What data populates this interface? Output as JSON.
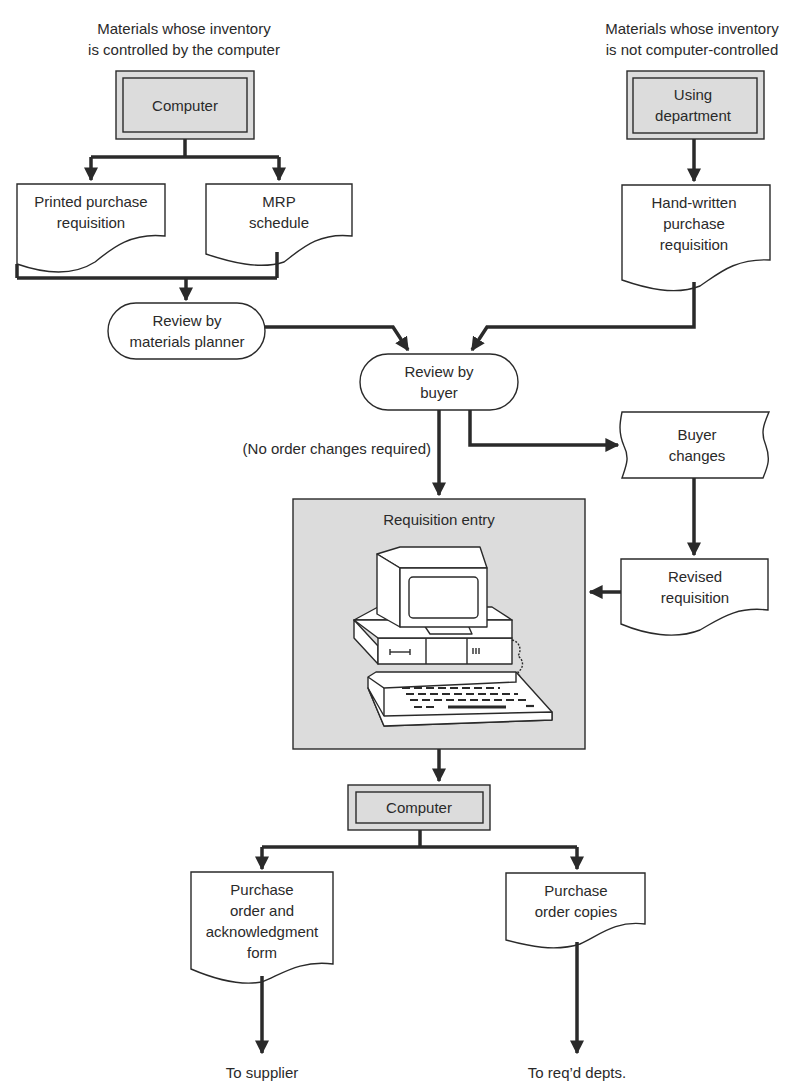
{
  "diagram": {
    "type": "flowchart",
    "headers": {
      "left": [
        "Materials whose inventory",
        "is controlled by the computer"
      ],
      "right": [
        "Materials whose inventory",
        "is not computer-controlled"
      ]
    },
    "nodes": {
      "computer_top": {
        "shape": "double-box",
        "label": [
          "Computer"
        ]
      },
      "using_department": {
        "shape": "double-box",
        "label": [
          "Using",
          "department"
        ]
      },
      "printed_requisition": {
        "shape": "document",
        "label": [
          "Printed purchase",
          "requisition"
        ]
      },
      "mrp_schedule": {
        "shape": "document",
        "label": [
          "MRP",
          "schedule"
        ]
      },
      "handwritten_requisition": {
        "shape": "document",
        "label": [
          "Hand-written",
          "purchase",
          "requisition"
        ]
      },
      "review_planner": {
        "shape": "terminal",
        "label": [
          "Review by",
          "materials planner"
        ]
      },
      "review_buyer": {
        "shape": "terminal",
        "label": [
          "Review by",
          "buyer"
        ]
      },
      "buyer_changes": {
        "shape": "punched-tape",
        "label": [
          "Buyer",
          "changes"
        ]
      },
      "revised_requisition": {
        "shape": "document",
        "label": [
          "Revised",
          "requisition"
        ]
      },
      "requisition_entry": {
        "shape": "shaded-box",
        "label": [
          "Requisition entry"
        ],
        "icon": "desktop-computer-icon"
      },
      "computer_bottom": {
        "shape": "double-box",
        "label": [
          "Computer"
        ]
      },
      "po_ack_form": {
        "shape": "document",
        "label": [
          "Purchase",
          "order and",
          "acknowledgment",
          "form"
        ]
      },
      "po_copies": {
        "shape": "document",
        "label": [
          "Purchase",
          "order copies"
        ]
      }
    },
    "edge_labels": {
      "no_changes": "(No order changes required)"
    },
    "outputs": {
      "supplier": "To supplier",
      "depts": "To req’d depts."
    },
    "colors": {
      "ink": "#2a2a2a",
      "shade": "#dcdcdc",
      "background": "#ffffff"
    }
  }
}
